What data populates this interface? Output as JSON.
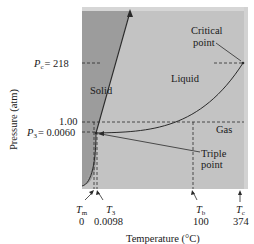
{
  "diagram": {
    "colors": {
      "solid_region": "#9c9c9c",
      "fluid_region": "#c3c3c3",
      "top_band": "#d6d6d6",
      "right_band": "#d2d2d2",
      "line": "#2a2a2a"
    },
    "regions": {
      "solid": "Solid",
      "liquid": "Liquid",
      "gas": "Gas"
    },
    "y_axis": {
      "label": "Pressure (atm)",
      "ticks": [
        {
          "symbol": "P",
          "sub": "c",
          "value": "= 218"
        },
        {
          "symbol": "",
          "sub": "",
          "value": "1.00"
        },
        {
          "symbol": "P",
          "sub": "3",
          "value": "= 0.0060"
        }
      ]
    },
    "x_axis": {
      "label": "Temperature (°C)",
      "ticks": [
        {
          "symbol": "T",
          "sub": "m",
          "value": "0"
        },
        {
          "symbol": "T",
          "sub": "3",
          "value": "0.0098"
        },
        {
          "symbol": "T",
          "sub": "b",
          "value": "100"
        },
        {
          "symbol": "T",
          "sub": "c",
          "value": "374"
        }
      ]
    },
    "annotations": {
      "critical_point": [
        "Critical",
        "point"
      ],
      "triple_point": [
        "Triple",
        "point"
      ]
    }
  }
}
